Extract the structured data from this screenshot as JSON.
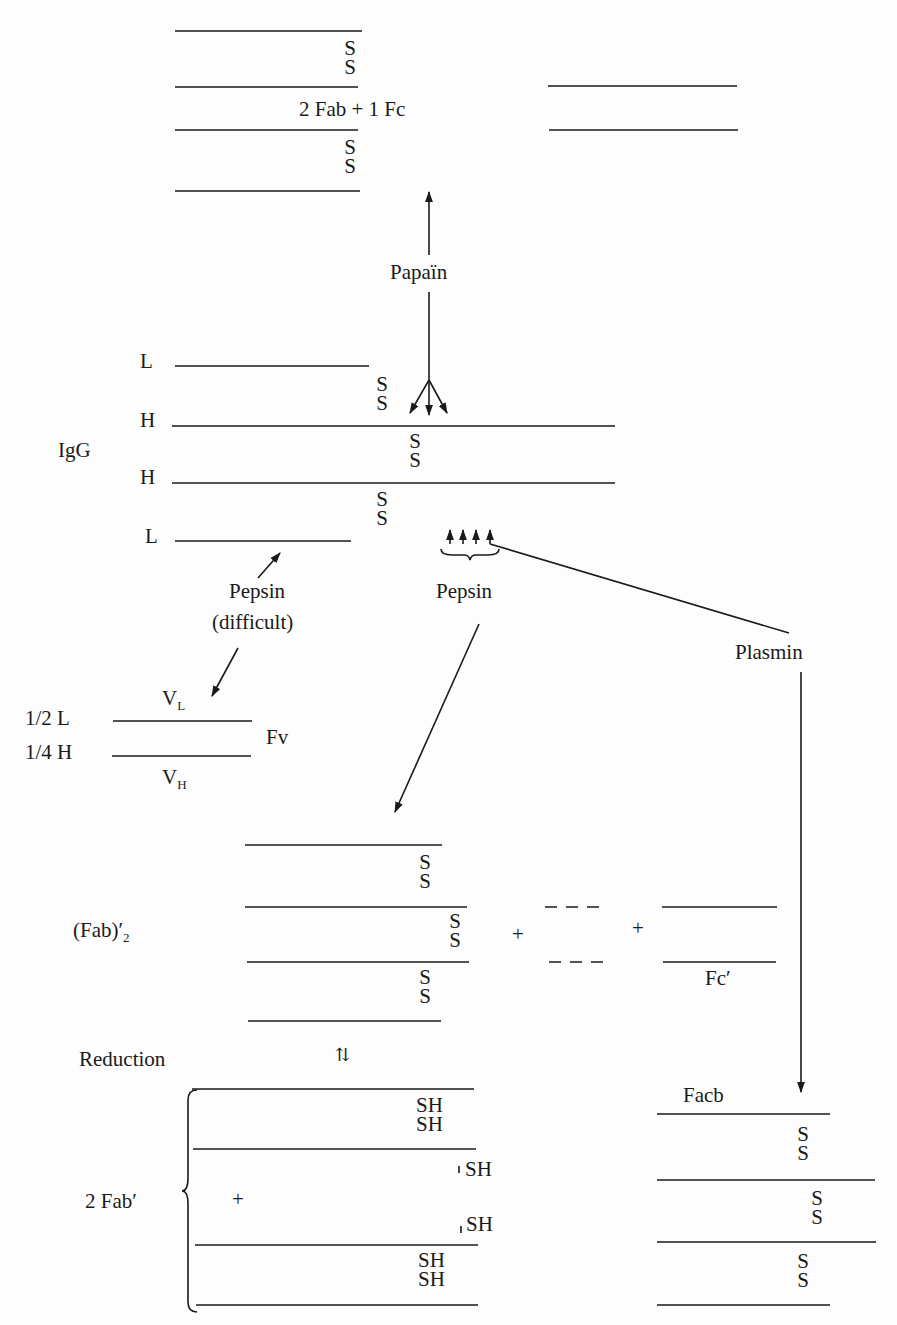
{
  "diagram": {
    "colors": {
      "ink": "#1a1a1a",
      "background": "#fdfdfd"
    },
    "disulfide_label": "S",
    "thiol_label": "SH",
    "papain_products": {
      "label": "2 Fab + 1 Fc"
    },
    "enzymes": {
      "papain": "Papaïn",
      "pepsin_difficult_line1": "Pepsin",
      "pepsin_difficult_line2": "(difficult)",
      "pepsin": "Pepsin",
      "plasmin": "Plasmin"
    },
    "igg": {
      "label": "IgG",
      "chains": [
        "L",
        "H",
        "H",
        "L"
      ]
    },
    "fv": {
      "half_light": "1/2 L",
      "quarter_heavy": "1/4 H",
      "vl_main": "V",
      "vl_sub": "L",
      "vh_main": "V",
      "vh_sub": "H",
      "label": "Fv"
    },
    "fab2": {
      "label_main": "(Fab)",
      "label_prime": "′",
      "label_sub": "2",
      "plus1": "+",
      "plus2": "+",
      "fc_prime": "Fc′"
    },
    "reduction": {
      "label": "Reduction",
      "equilibrium_symbol": "⇅",
      "product_label": "2 Fab′",
      "plus": "+"
    },
    "facb": {
      "label": "Facb"
    }
  }
}
